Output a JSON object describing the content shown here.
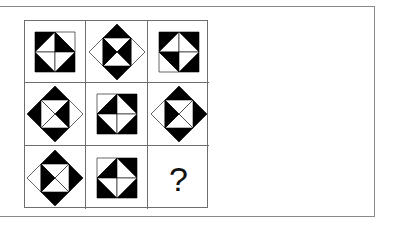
{
  "puzzle": {
    "title": "3x3 figure reasoning matrix",
    "question_mark": "?",
    "colors": {
      "fill": "#000000",
      "empty": "#ffffff",
      "line": "#6e6e6e"
    },
    "cells": [
      {
        "row": 0,
        "col": 0,
        "outer": "square",
        "corners": {
          "tl": "black",
          "tr": "white",
          "bl": "black",
          "br": "black"
        },
        "inner": {
          "tl": "white",
          "tr": "black",
          "bl": "white",
          "br": "white"
        }
      },
      {
        "row": 0,
        "col": 1,
        "outer": "diamond",
        "corners": {
          "top": "black",
          "right": "white",
          "bottom": "black",
          "left": "white"
        },
        "inner": {
          "top": "white",
          "right": "black",
          "bottom": "white",
          "left": "black"
        }
      },
      {
        "row": 0,
        "col": 2,
        "outer": "square",
        "corners": {
          "tl": "black",
          "tr": "black",
          "bl": "white",
          "br": "black"
        },
        "inner": {
          "tl": "white",
          "tr": "white",
          "bl": "black",
          "br": "white"
        }
      },
      {
        "row": 1,
        "col": 0,
        "outer": "diamond",
        "corners": {
          "top": "black",
          "right": "white",
          "bottom": "black",
          "left": "black"
        },
        "inner": {
          "top": "white",
          "right": "black",
          "bottom": "white",
          "left": "white"
        }
      },
      {
        "row": 1,
        "col": 1,
        "outer": "square",
        "corners": {
          "tl": "white",
          "tr": "black",
          "bl": "black",
          "br": "black"
        },
        "inner": {
          "tl": "black",
          "tr": "white",
          "bl": "white",
          "br": "white"
        }
      },
      {
        "row": 1,
        "col": 2,
        "outer": "diamond",
        "corners": {
          "top": "black",
          "right": "black",
          "bottom": "black",
          "left": "white"
        },
        "inner": {
          "top": "white",
          "right": "white",
          "bottom": "white",
          "left": "black"
        }
      },
      {
        "row": 2,
        "col": 0,
        "outer": "diamond",
        "corners": {
          "top": "black",
          "right": "black",
          "bottom": "black",
          "left": "white"
        },
        "inner": {
          "top": "white",
          "right": "white",
          "bottom": "white",
          "left": "black"
        }
      },
      {
        "row": 2,
        "col": 1,
        "outer": "square",
        "corners": {
          "tl": "white",
          "tr": "black",
          "bl": "black",
          "br": "black"
        },
        "inner": {
          "tl": "black",
          "tr": "white",
          "bl": "white",
          "br": "white"
        }
      },
      {
        "row": 2,
        "col": 2,
        "outer": "unknown",
        "label": "?"
      }
    ]
  }
}
